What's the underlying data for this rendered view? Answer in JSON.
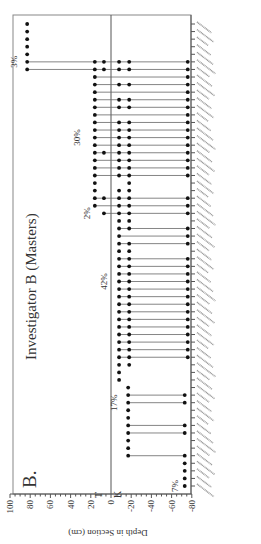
{
  "chart_data": {
    "type": "scatter",
    "orientation": "rotated-90-ccw",
    "panel_label": "B.",
    "title": "Investigator B (Masters)",
    "ylabel": "Depth in Section (cm)",
    "xlabel": "",
    "ylim": [
      -80,
      100
    ],
    "yticks": [
      100,
      80,
      60,
      40,
      20,
      0,
      -20,
      -40,
      -60,
      -80
    ],
    "boundary": {
      "depth": 0,
      "above_label": "T",
      "below_label": "K"
    },
    "grid": false,
    "legend": null,
    "annotations": [
      {
        "text": "7%",
        "row": 1,
        "depth": -66
      },
      {
        "text": "17%",
        "row": 12,
        "depth": -6
      },
      {
        "text": "42%",
        "row": 28,
        "depth": 4
      },
      {
        "text": "2%",
        "row": 37,
        "depth": 21
      },
      {
        "text": "30%",
        "row": 47,
        "depth": 31
      },
      {
        "text": "3%",
        "row": 57,
        "depth": 93
      }
    ],
    "taxa_count": 59,
    "taxa_note": "Taxon names along the bottom axis are illegible at this resolution",
    "rows": [
      {
        "row": 1,
        "dots": [
          -73
        ]
      },
      {
        "row": 2,
        "dots": [
          -73
        ]
      },
      {
        "row": 3,
        "dots": [
          -73
        ]
      },
      {
        "row": 4,
        "dots": [
          -73
        ]
      },
      {
        "row": 5,
        "dots": [
          -17,
          -73
        ],
        "line": true
      },
      {
        "row": 6,
        "dots": [
          -17
        ]
      },
      {
        "row": 7,
        "dots": [
          -17
        ]
      },
      {
        "row": 8,
        "dots": [
          -17,
          -73
        ],
        "line": true
      },
      {
        "row": 9,
        "dots": [
          -17,
          -73
        ],
        "line": true
      },
      {
        "row": 10,
        "dots": [
          -17
        ]
      },
      {
        "row": 11,
        "dots": [
          -17
        ]
      },
      {
        "row": 12,
        "dots": [
          -17,
          -73
        ],
        "line": true
      },
      {
        "row": 13,
        "dots": [
          -17,
          -73
        ],
        "line": true
      },
      {
        "row": 14,
        "dots": [
          -17
        ]
      },
      {
        "row": 15,
        "dots": [
          -8
        ]
      },
      {
        "row": 16,
        "dots": [
          -8
        ]
      },
      {
        "row": 17,
        "dots": [
          -8,
          -18
        ]
      },
      {
        "row": 18,
        "dots": [
          -8,
          -18,
          -76
        ],
        "line": true
      },
      {
        "row": 19,
        "dots": [
          -8,
          -18,
          -76
        ],
        "line": true
      },
      {
        "row": 20,
        "dots": [
          -8,
          -18,
          -76
        ],
        "line": true
      },
      {
        "row": 21,
        "dots": [
          -8,
          -18,
          -76
        ],
        "line": true
      },
      {
        "row": 22,
        "dots": [
          -8,
          -18,
          -76
        ],
        "line": true
      },
      {
        "row": 23,
        "dots": [
          -8,
          -18,
          -76
        ],
        "line": true
      },
      {
        "row": 24,
        "dots": [
          -8,
          -18,
          -76
        ],
        "line": true
      },
      {
        "row": 25,
        "dots": [
          -8,
          -18,
          -76
        ],
        "line": true
      },
      {
        "row": 26,
        "dots": [
          -8,
          -18,
          -76
        ],
        "line": true
      },
      {
        "row": 27,
        "dots": [
          -8,
          -18,
          -76
        ],
        "line": true
      },
      {
        "row": 28,
        "dots": [
          -8,
          -18,
          -76
        ],
        "line": true
      },
      {
        "row": 29,
        "dots": [
          -8,
          -18,
          -76
        ],
        "line": true
      },
      {
        "row": 30,
        "dots": [
          -8,
          -18,
          -76
        ],
        "line": true
      },
      {
        "row": 31,
        "dots": [
          -8,
          -18,
          -76
        ],
        "line": true
      },
      {
        "row": 32,
        "dots": [
          -8,
          -18
        ]
      },
      {
        "row": 33,
        "dots": [
          -8,
          -18,
          -76
        ],
        "line": true
      },
      {
        "row": 34,
        "dots": [
          -8,
          -76
        ],
        "line": true
      },
      {
        "row": 35,
        "dots": [
          -8,
          -18,
          -76
        ],
        "line": true
      },
      {
        "row": 36,
        "dots": [
          -8,
          -18
        ]
      },
      {
        "row": 37,
        "dots": [
          7,
          -8,
          -18,
          -76
        ],
        "line": true
      },
      {
        "row": 38,
        "dots": [
          16,
          -8,
          -18,
          -76
        ],
        "line": true
      },
      {
        "row": 39,
        "dots": [
          16,
          7,
          -8,
          -18,
          -76
        ],
        "line": true
      },
      {
        "row": 40,
        "dots": [
          16,
          -8,
          -18
        ]
      },
      {
        "row": 41,
        "dots": [
          16,
          -18
        ]
      },
      {
        "row": 42,
        "dots": [
          16,
          -8,
          -18,
          -76
        ],
        "line": true
      },
      {
        "row": 43,
        "dots": [
          16,
          -8,
          -18,
          -76
        ],
        "line": true
      },
      {
        "row": 44,
        "dots": [
          16,
          -8,
          -18,
          -76
        ],
        "line": true
      },
      {
        "row": 45,
        "dots": [
          16,
          7,
          -8,
          -18,
          -76
        ],
        "line": true
      },
      {
        "row": 46,
        "dots": [
          16,
          -8,
          -18,
          -76
        ],
        "line": true
      },
      {
        "row": 47,
        "dots": [
          16,
          -8,
          -18,
          -76
        ],
        "line": true
      },
      {
        "row": 48,
        "dots": [
          16,
          -8,
          -18,
          -76
        ],
        "line": true
      },
      {
        "row": 49,
        "dots": [
          16,
          -8,
          -18,
          -76
        ],
        "line": true
      },
      {
        "row": 50,
        "dots": [
          16,
          -76
        ],
        "line": true
      },
      {
        "row": 51,
        "dots": [
          16,
          -8,
          -18,
          -76
        ],
        "line": true
      },
      {
        "row": 52,
        "dots": [
          16,
          -8,
          -18,
          -76
        ],
        "line": true
      },
      {
        "row": 53,
        "dots": [
          16,
          -76
        ],
        "line": true
      },
      {
        "row": 54,
        "dots": [
          16,
          -8,
          -18,
          -76
        ],
        "line": true
      },
      {
        "row": 55,
        "dots": [
          16,
          -76
        ],
        "line": true
      },
      {
        "row": 56,
        "dots": [
          83,
          16,
          7,
          -8,
          -18,
          -76
        ],
        "line": true
      },
      {
        "row": 57,
        "dots": [
          83,
          16,
          7,
          -8,
          -18,
          -76
        ],
        "line": true
      },
      {
        "row": 58,
        "dots": [
          83
        ]
      },
      {
        "row": 59,
        "dots": [
          83
        ]
      },
      {
        "row": 60,
        "dots": [
          83
        ]
      },
      {
        "row": 61,
        "dots": [
          83
        ]
      },
      {
        "row": 62,
        "dots": [
          83
        ]
      }
    ]
  }
}
